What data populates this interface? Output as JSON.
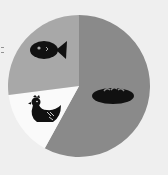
{
  "chart_data": {
    "type": "pie",
    "title": "",
    "start_angle_deg": 0,
    "direction": "clockwise",
    "slices": [
      {
        "label": "bread",
        "icon": "bread-icon",
        "value": 58,
        "color": "#8a8a8a"
      },
      {
        "label": "chicken",
        "icon": "chicken-icon",
        "value": 15,
        "color": "#fafafa"
      },
      {
        "label": "fish",
        "icon": "fish-icon",
        "value": 27,
        "color": "#a8a8a8"
      }
    ],
    "legend": "none (icons drawn inside slices)"
  },
  "colors": {
    "background": "#efefef",
    "icon": "#111111"
  }
}
